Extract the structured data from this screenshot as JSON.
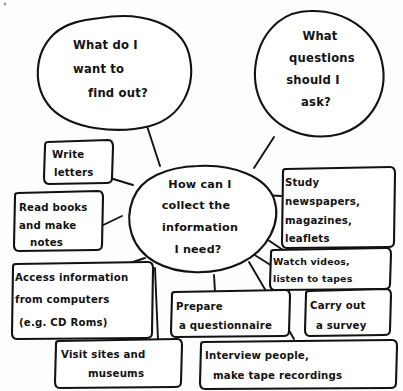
{
  "diagram": {
    "title": "How can I collect the information I need?",
    "type": "hand-drawn-mind-map",
    "ink_color": "#121212",
    "background_color": "#fdfdfd",
    "center": {
      "id": "center",
      "shape": "ellipse",
      "lines": [
        "How can I",
        "collect the",
        "information",
        "I need?"
      ]
    },
    "bubbles": [
      {
        "id": "bubble-find-out",
        "shape": "speech-bubble",
        "lines": [
          "What do I",
          "want to",
          "find out?"
        ]
      },
      {
        "id": "bubble-questions",
        "shape": "speech-bubble",
        "lines": [
          "What",
          "questions",
          "should I",
          "ask?"
        ]
      }
    ],
    "boxes": [
      {
        "id": "box-write-letters",
        "shape": "rounded-rect",
        "lines": [
          "Write",
          "letters"
        ]
      },
      {
        "id": "box-read-books",
        "shape": "rounded-rect",
        "lines": [
          "Read books",
          "and make",
          "notes"
        ]
      },
      {
        "id": "box-access-information",
        "shape": "rounded-rect",
        "lines": [
          "Access information",
          "from computers",
          "(e.g. CD Roms)"
        ]
      },
      {
        "id": "box-visit-sites",
        "shape": "rounded-rect",
        "lines": [
          "Visit sites and",
          "museums"
        ]
      },
      {
        "id": "box-prepare-questionnaire",
        "shape": "rounded-rect",
        "lines": [
          "Prepare",
          "a questionnaire"
        ]
      },
      {
        "id": "box-interview-people",
        "shape": "rounded-rect",
        "lines": [
          "Interview people,",
          "make tape recordings"
        ]
      },
      {
        "id": "box-study-newspapers",
        "shape": "rounded-rect",
        "lines": [
          "Study",
          "newspapers,",
          "magazines,",
          "leaflets"
        ]
      },
      {
        "id": "box-watch-videos",
        "shape": "rounded-rect",
        "lines": [
          "Watch videos,",
          "listen to tapes"
        ]
      },
      {
        "id": "box-carry-out-survey",
        "shape": "rounded-rect",
        "lines": [
          "Carry out",
          "a survey"
        ]
      }
    ]
  }
}
